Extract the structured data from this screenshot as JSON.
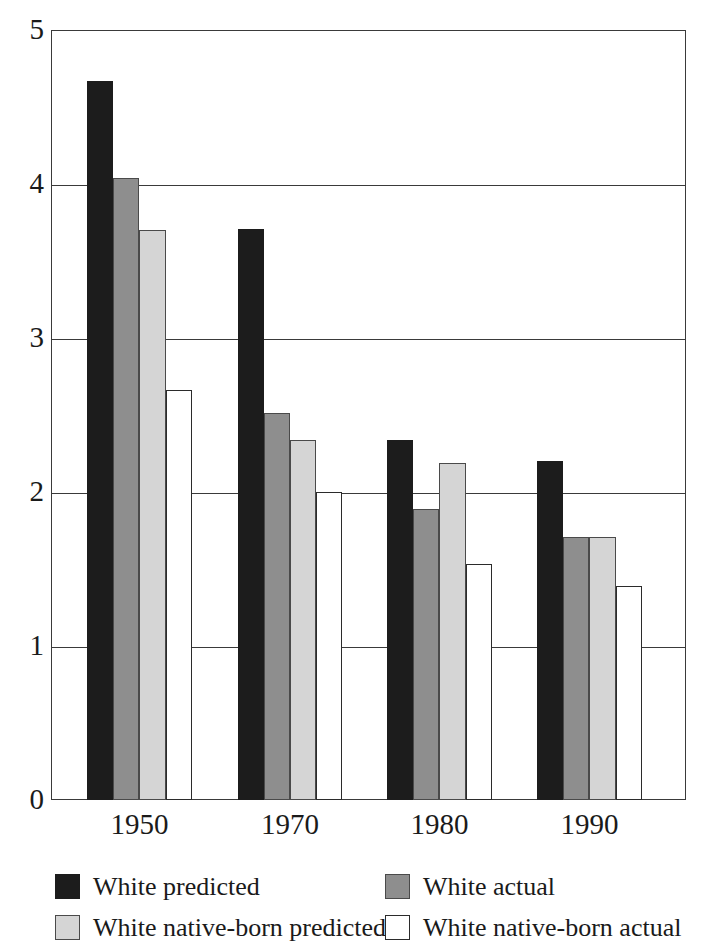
{
  "chart_data": {
    "type": "bar",
    "title": "",
    "xlabel": "",
    "ylabel": "",
    "categories": [
      "1950",
      "1970",
      "1980",
      "1990"
    ],
    "ylim": [
      0,
      5
    ],
    "yticks": [
      "0",
      "1",
      "2",
      "3",
      "4",
      "5"
    ],
    "grid": true,
    "legend_position": "bottom",
    "series": [
      {
        "name": "White predicted",
        "swatch": "sw-black",
        "color": "#1c1c1c",
        "values": [
          4.67,
          3.71,
          2.34,
          2.2
        ]
      },
      {
        "name": "White actual",
        "swatch": "sw-darkgray",
        "color": "#8e8e8e",
        "values": [
          4.04,
          2.51,
          1.89,
          1.71
        ]
      },
      {
        "name": "White native-born predicted",
        "swatch": "sw-lightgray",
        "color": "#d5d5d5",
        "values": [
          3.7,
          2.34,
          2.19,
          1.71
        ]
      },
      {
        "name": "White native-born actual",
        "swatch": "sw-white",
        "color": "#ffffff",
        "values": [
          2.66,
          2.0,
          1.53,
          1.39
        ]
      }
    ]
  },
  "legend": {
    "entries": [
      {
        "label": "White predicted",
        "swatch": "sw-black"
      },
      {
        "label": "White actual",
        "swatch": "sw-darkgray"
      },
      {
        "label": "White native-born predicted",
        "swatch": "sw-lightgray"
      },
      {
        "label": "White native-born actual",
        "swatch": "sw-white"
      }
    ]
  }
}
